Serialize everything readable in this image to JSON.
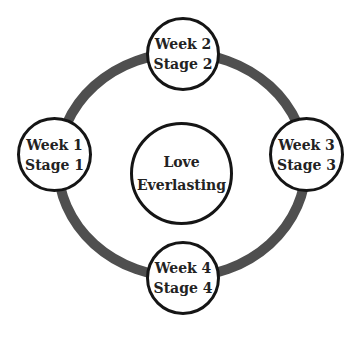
{
  "diagram": {
    "type": "cycle",
    "ring_color": "#4f4f4f",
    "center": {
      "line1": "Love",
      "line2": "Everlasting"
    },
    "nodes": [
      {
        "line1": "Week 1",
        "line2": "Stage 1"
      },
      {
        "line1": "Week 2",
        "line2": "Stage 2"
      },
      {
        "line1": "Week 3",
        "line2": "Stage 3"
      },
      {
        "line1": "Week 4",
        "line2": "Stage 4"
      }
    ]
  }
}
